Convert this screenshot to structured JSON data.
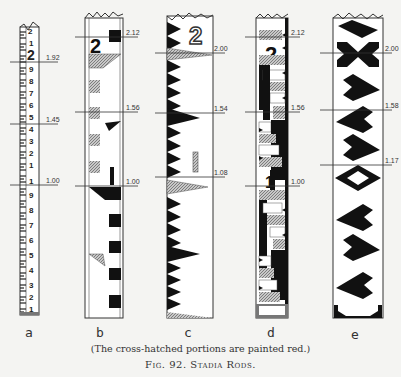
{
  "figure": {
    "caption": "(The cross-hatched portions are painted red.)",
    "title": "Fig. 92.   Stadia Rods.",
    "colors": {
      "background": "#f4f4f2",
      "ink": "#111111",
      "red_hatch": "#9a9a9a"
    }
  },
  "rods": [
    {
      "letter": "a",
      "readings": [
        "1.92",
        "1.45",
        "1.00"
      ],
      "digits_top": [
        "2",
        "1",
        "2",
        "9",
        "8",
        "7",
        "6",
        "5",
        "4",
        "3",
        "2",
        "1",
        "1"
      ],
      "digits_bottom": [
        "9",
        "8",
        "7",
        "6",
        "5",
        "4",
        "3",
        "2",
        "1"
      ]
    },
    {
      "letter": "b",
      "readings": [
        "2.12",
        "1.56",
        "1.00"
      ],
      "numerals": [
        "2",
        "1"
      ]
    },
    {
      "letter": "c",
      "readings": [
        "2.00",
        "1.54",
        "1.08"
      ],
      "numerals": [
        "2"
      ]
    },
    {
      "letter": "d",
      "readings": [
        "2.12",
        "1.56",
        "1.00"
      ],
      "numerals": [
        "2",
        "1"
      ]
    },
    {
      "letter": "e",
      "readings": [
        "2.00",
        "1.58",
        "1.17"
      ]
    }
  ]
}
